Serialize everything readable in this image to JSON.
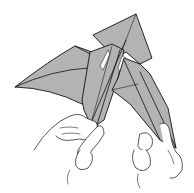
{
  "diagram": {
    "colors": {
      "paper": "#b3b3b3",
      "outline": "#111111",
      "background": "#ffffff"
    },
    "elements": [
      "left-wing",
      "center-body",
      "right-wing",
      "top-flap",
      "left-hand",
      "right-hand"
    ]
  }
}
